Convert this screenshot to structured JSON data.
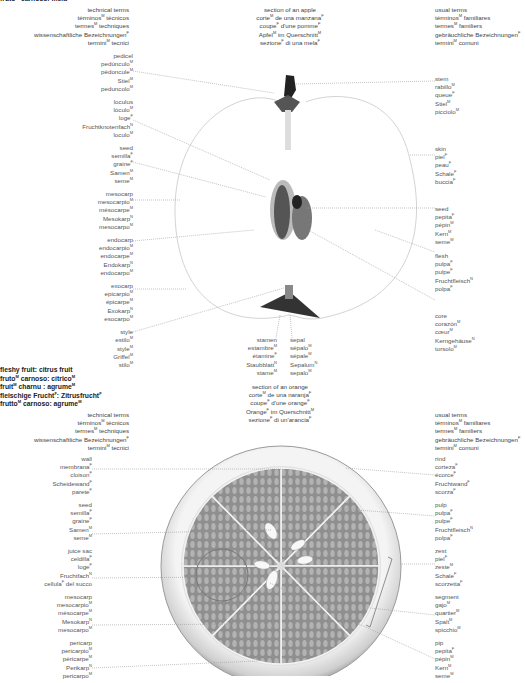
{
  "apple_title_partial": "frutoᴹ carnoso: mela",
  "apple": {
    "technical_header": [
      "technical terms",
      "términos|M| técnicos",
      "termes|M| techniques",
      "wissenschaftliche Bezeichnungen|F|",
      "termini|M| tecnici"
    ],
    "section_title": [
      "section of an apple",
      "corte|M| de una manzana|F|",
      "coupe|F| d'une pomme|F|",
      "Apfel|M| im Querschnitt|M|",
      "sezione|F| di una mela|F|"
    ],
    "usual_header": [
      "usual terms",
      "términos|M| familiares",
      "termes|M| familiers",
      "gebräuchliche Bezeichnungen|F|",
      "termini|M| comuni"
    ],
    "left_labels": [
      {
        "name": "pedicel",
        "terms": [
          "pedicel",
          "pedúnculo|M|",
          "pédoncule|M|",
          "Stiel|M|",
          "peduncolo|M|"
        ]
      },
      {
        "name": "loculus",
        "terms": [
          "loculus",
          "lóculo|M|",
          "loge|F|",
          "Fruchtknotenfach|N|",
          "loculo|M|"
        ]
      },
      {
        "name": "seed",
        "terms": [
          "seed",
          "semilla|F|",
          "graine|F|",
          "Samen|M|",
          "seme|M|"
        ]
      },
      {
        "name": "mesocarp",
        "terms": [
          "mesocarp",
          "mesocarpio|M|",
          "mésocarpe|M|",
          "Mesokarp|N|",
          "mesocarpo|M|"
        ]
      },
      {
        "name": "endocarp",
        "terms": [
          "endocarp",
          "endocarpio|M|",
          "endocarpe|M|",
          "Endokarp|N|",
          "endocarpo|M|"
        ]
      },
      {
        "name": "exocarp",
        "terms": [
          "exocarp",
          "epicarpio|M|",
          "épicarpe|M|",
          "Exokarp|N|",
          "esocarpo|M|"
        ]
      },
      {
        "name": "style",
        "terms": [
          "style",
          "estilo|M|",
          "style|M|",
          "Griffel|M|",
          "stilo|M|"
        ]
      }
    ],
    "right_labels": [
      {
        "name": "stem",
        "terms": [
          "stem",
          "rabillo|M|",
          "queue|F|",
          "Stiel|M|",
          "picciolo|M|"
        ]
      },
      {
        "name": "skin",
        "terms": [
          "skin",
          "piel|F|",
          "peau|F|",
          "Schale|F|",
          "buccia|F|"
        ]
      },
      {
        "name": "seed",
        "terms": [
          "seed",
          "pepita|F|",
          "pépin|M|",
          "Kern|M|",
          "seme|M|"
        ]
      },
      {
        "name": "flesh",
        "terms": [
          "flesh",
          "pulpa|F|",
          "pulpe|F|",
          "Fruchtfleisch|N|",
          "polpa|F|"
        ]
      },
      {
        "name": "core",
        "terms": [
          "core",
          "corazón|M|",
          "cœur|M|",
          "Kerngehäuse|N|",
          "torsolo|M|"
        ]
      }
    ],
    "bottom_labels": [
      {
        "name": "stamen",
        "terms": [
          "stamen",
          "estambre|M|",
          "étamine|F|",
          "Staubblatt|N|",
          "stame|M|"
        ]
      },
      {
        "name": "sepal",
        "terms": [
          "sepal",
          "sépalo|M|",
          "sépale|M|",
          "Sepalum|N|",
          "sepalo|M|"
        ]
      }
    ]
  },
  "citrus_title": [
    "fleshy fruit: citrus fruit",
    "fruto|M| carnoso: cítrico|M|",
    "fruit|M| charnu : agrume|M|",
    "fleischige Frucht|F|: Zitrusfrucht|F|",
    "frutto|M| carnoso: agrume|M|"
  ],
  "orange": {
    "technical_header": [
      "technical terms",
      "términos|M| técnicos",
      "termes|M| techniques",
      "wissenschaftliche Bezeichnungen|F|",
      "termini|M| tecnici"
    ],
    "section_title": [
      "section of an orange",
      "corte|M| de una naranja|F|",
      "coupe|F| d'une orange|F|",
      "Orange|F| im Querschnitt|M|",
      "sezione|F| di un'arancia|F|"
    ],
    "usual_header": [
      "usual terms",
      "términos|M| familiares",
      "termes|M| familiers",
      "gebräuchliche Bezeichnungen|F|",
      "termini|M| comuni"
    ],
    "left_labels": [
      {
        "name": "wall",
        "terms": [
          "wall",
          "membrana|F|",
          "cloison|F|",
          "Scheidewand|F|",
          "parete|F|"
        ]
      },
      {
        "name": "seed",
        "terms": [
          "seed",
          "semilla|F|",
          "graine|F|",
          "Samen|M|",
          "seme|M|"
        ]
      },
      {
        "name": "juice-sac",
        "terms": [
          "juice sac",
          "celdilla|F|",
          "loge|F|",
          "Fruchtfach|N|",
          "cellula|F| del succo"
        ]
      },
      {
        "name": "mesocarp",
        "terms": [
          "mesocarp",
          "mesocarpio|M|",
          "mésocarpe|M|",
          "Mesokarp|N|",
          "mesocarpo|M|"
        ]
      },
      {
        "name": "pericarp",
        "terms": [
          "pericarp",
          "pericarpio|M|",
          "péricarpe|M|",
          "Perikarp|N|",
          "pericarpo|M|"
        ]
      }
    ],
    "right_labels": [
      {
        "name": "rind",
        "terms": [
          "rind",
          "corteza|F|",
          "écorce|F|",
          "Fruchtwand|F|",
          "scorza|F|"
        ]
      },
      {
        "name": "pulp",
        "terms": [
          "pulp",
          "pulpa|F|",
          "pulpe|F|",
          "Fruchtfleisch|N|",
          "polpa|F|"
        ]
      },
      {
        "name": "zest",
        "terms": [
          "zest",
          "piel|F|",
          "zeste|M|",
          "Schale|F|",
          "scorzetta|F|"
        ]
      },
      {
        "name": "segment",
        "terms": [
          "segment",
          "gajo|M|",
          "quartier|M|",
          "Spalt|M|",
          "spicchio|M|"
        ]
      },
      {
        "name": "pip",
        "terms": [
          "pip",
          "pepita|F|",
          "pépin|M|",
          "Kern|M|",
          "seme|M|"
        ]
      }
    ]
  },
  "colors": {
    "text": "#555555",
    "title": "#222222",
    "leader": "#9a9a9a",
    "orange_fill": "#9c9c9c",
    "rind": "#e6e6e6"
  }
}
